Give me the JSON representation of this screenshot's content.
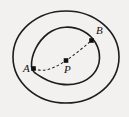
{
  "figure": {
    "background_color": "#f2f1ef",
    "stroke_color": "#1d1d1d",
    "dash_color": "#2a2a2a",
    "marker_color": "#111111",
    "width": 129,
    "height": 117
  },
  "shapes": {
    "outer_ellipse": {
      "name": "outer-ellipse",
      "cx": 66,
      "cy": 57,
      "rx": 53,
      "ry": 46
    },
    "inner_curve": {
      "name": "inner-closed-curve",
      "path": "M 31.5 66.5 C 31.0 55.0 37.5 41.5 48.0 33.5 C 58.5 25.5 72.5 25.5 83.0 31.0 C 93.5 36.5 100.0 47.0 99.5 58.5 C 99.0 70.0 91.0 79.5 79.0 83.0 C 67.0 86.5 53.5 84.0 44.0 78.5 C 35.5 73.5 32.0 72.0 31.5 66.5 Z"
    },
    "dashed_path": {
      "name": "dashed-arc-a-to-b",
      "path": "M 33.5 68.5 C 45.0 73.5 57.0 66.5 66.0 60.5 C 75.0 54.5 84.5 46.5 91.5 40.5"
    }
  },
  "points": [
    {
      "id": "A",
      "label": "A",
      "x": 33.5,
      "y": 68.5,
      "label_x": 23,
      "label_y": 72,
      "marker_size": 2.3
    },
    {
      "id": "P",
      "label": "P",
      "x": 66,
      "y": 60.5,
      "label_x": 64,
      "label_y": 73,
      "marker_size": 2.3
    },
    {
      "id": "B",
      "label": "B",
      "x": 91.5,
      "y": 40.5,
      "label_x": 96,
      "label_y": 34,
      "marker_size": 2.3
    }
  ]
}
